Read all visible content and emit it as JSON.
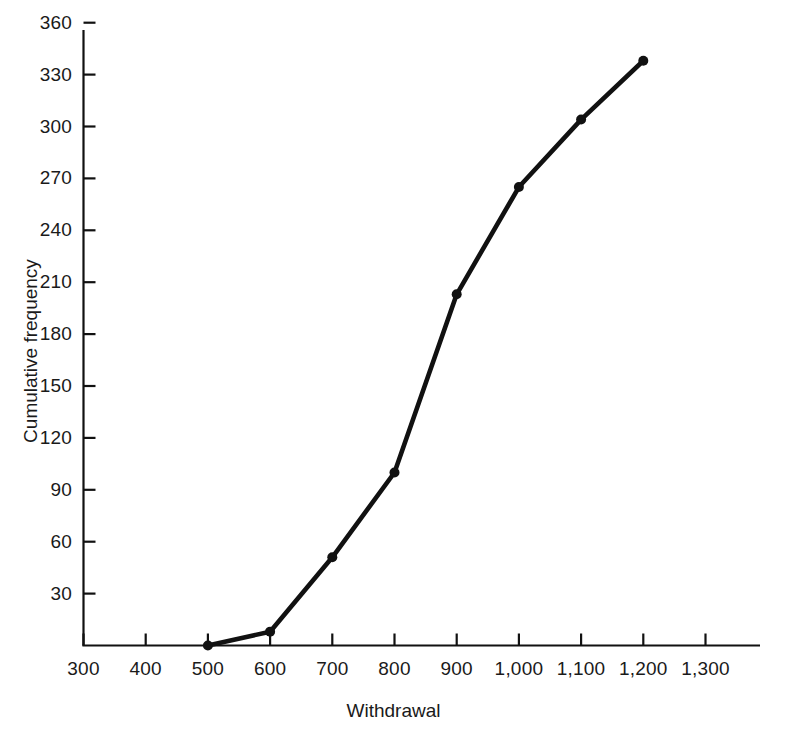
{
  "chart_data": {
    "type": "line",
    "title": "",
    "xlabel": "Withdrawal",
    "ylabel": "Cumulative frequency",
    "xlim": [
      300,
      1300
    ],
    "ylim": [
      0,
      370
    ],
    "grid": false,
    "legend": false,
    "xticks": [
      300,
      400,
      500,
      600,
      700,
      800,
      900,
      1000,
      1100,
      1200,
      1300
    ],
    "xtick_labels": [
      "300",
      "400",
      "500",
      "600",
      "700",
      "800",
      "900",
      "1,000",
      "1,100",
      "1,200",
      "1,300"
    ],
    "yticks": [
      30,
      60,
      90,
      120,
      150,
      180,
      210,
      240,
      270,
      300,
      330,
      360
    ],
    "ytick_labels": [
      "30",
      "60",
      "90",
      "120",
      "150",
      "180",
      "210",
      "240",
      "270",
      "300",
      "330",
      "360"
    ],
    "series": [
      {
        "name": "Cumulative frequency",
        "color": "#111111",
        "marker": "circle",
        "x": [
          500,
          600,
          700,
          800,
          900,
          1000,
          1100,
          1200
        ],
        "values": [
          0,
          8,
          51,
          100,
          203,
          265,
          304,
          338
        ],
        "points": [
          {
            "x": 500,
            "y": 0
          },
          {
            "x": 600,
            "y": 8
          },
          {
            "x": 700,
            "y": 51
          },
          {
            "x": 800,
            "y": 100
          },
          {
            "x": 900,
            "y": 203
          },
          {
            "x": 1000,
            "y": 265
          },
          {
            "x": 1100,
            "y": 304
          },
          {
            "x": 1200,
            "y": 338
          }
        ]
      }
    ]
  },
  "axes": {
    "x_title": "Withdrawal",
    "y_title": "Cumulative frequency"
  }
}
